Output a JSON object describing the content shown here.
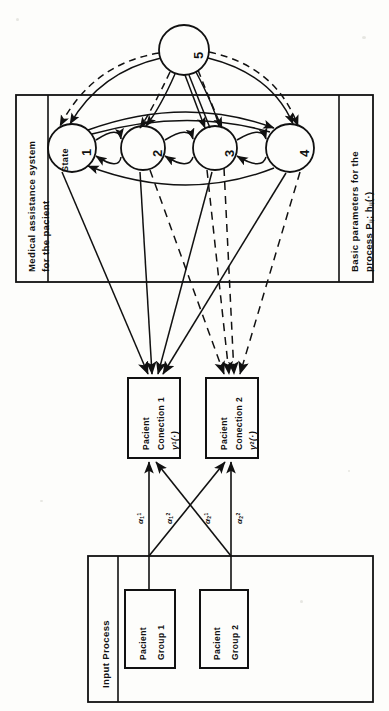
{
  "figure": {
    "orientation": "rotated-90-ccw",
    "ink_color": "#111111",
    "paper_color": "#fdfdfb"
  },
  "frames": {
    "upper": {
      "left_title_line1": "Medical assistance system",
      "left_title_line2": "for  the  pacient",
      "right_title_line1": "Basic  parameters  for  the",
      "right_title_line2_prefix": "process P",
      "right_title_line2_sub1": "ij",
      "right_title_line2_mid": "; h",
      "right_title_line2_sub2": "ij",
      "right_title_line2_tail": "(·)"
    },
    "lower": {
      "title": "Input  Process"
    }
  },
  "states": {
    "state_word": "State",
    "nodes": [
      {
        "id": "s1",
        "label": "1",
        "cx": 72,
        "cy": 148,
        "r": 24
      },
      {
        "id": "s2",
        "label": "2",
        "cx": 143,
        "cy": 148,
        "r": 22
      },
      {
        "id": "s3",
        "label": "3",
        "cx": 215,
        "cy": 148,
        "r": 22
      },
      {
        "id": "s4",
        "label": "4",
        "cx": 290,
        "cy": 148,
        "r": 24
      },
      {
        "id": "s5",
        "label": "5",
        "cx": 184,
        "cy": 50,
        "r": 25
      }
    ]
  },
  "connection_boxes": [
    {
      "id": "pc1",
      "line1": "Pacient",
      "line2": "Conection 1",
      "symbol_base": "γ",
      "symbol_sup": "1",
      "symbol_tail": "(·)",
      "x": 128,
      "y": 378,
      "w": 52,
      "h": 80
    },
    {
      "id": "pc2",
      "line1": "Pacient",
      "line2": "Conection 2",
      "symbol_base": "γ",
      "symbol_sup": "2",
      "symbol_tail": "(·)",
      "x": 206,
      "y": 378,
      "w": 52,
      "h": 80
    }
  ],
  "group_boxes": [
    {
      "id": "pg1",
      "line1": "Pacient",
      "line2": "Group 1",
      "x": 125,
      "y": 590,
      "w": 50,
      "h": 78
    },
    {
      "id": "pg2",
      "line1": "Pacient",
      "line2": "Group 2",
      "x": 200,
      "y": 590,
      "w": 48,
      "h": 78
    }
  ],
  "flow_labels": [
    {
      "id": "a1_1",
      "base": "α",
      "sub": "1",
      "sup": "1",
      "x": 128,
      "y": 512
    },
    {
      "id": "a2_1",
      "base": "α",
      "sub": "1",
      "sup": "2",
      "x": 158,
      "y": 512
    },
    {
      "id": "a1_2",
      "base": "α",
      "sub": "2",
      "sup": "1",
      "x": 196,
      "y": 512
    },
    {
      "id": "a2_2",
      "base": "α",
      "sub": "2",
      "sup": "2",
      "x": 228,
      "y": 512
    }
  ]
}
